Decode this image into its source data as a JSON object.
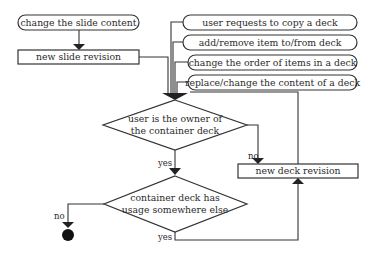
{
  "diagram": {
    "type": "flowchart",
    "events": [
      {
        "id": "change-slide",
        "label": "change the slide content"
      },
      {
        "id": "copy-deck",
        "label": "user requests to copy a deck"
      },
      {
        "id": "add-remove",
        "label": "add/remove item to/from deck"
      },
      {
        "id": "change-order",
        "label": "change the order of items in a deck"
      },
      {
        "id": "replace-content",
        "label": "replace/change the content of a deck"
      }
    ],
    "processes": [
      {
        "id": "new-slide-revision",
        "label": "new slide revision"
      },
      {
        "id": "new-deck-revision",
        "label": "new deck revision"
      }
    ],
    "decisions": [
      {
        "id": "is-owner",
        "line1": "user is the owner of",
        "line2": "the container deck"
      },
      {
        "id": "has-usage",
        "line1": "container deck has",
        "line2": "usage somewhere else"
      }
    ],
    "edge_labels": {
      "owner_yes": "yes",
      "owner_no": "no",
      "usage_no": "no",
      "usage_yes": "yes"
    }
  }
}
